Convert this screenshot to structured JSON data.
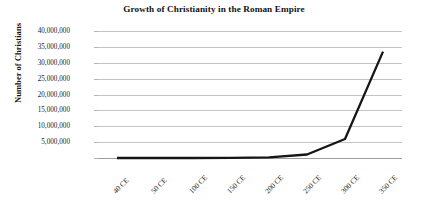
{
  "chart_data": {
    "type": "line",
    "title": "Growth of Christianity in the Roman Empire",
    "xlabel": "",
    "ylabel": "Number of Christians",
    "categories": [
      "40 CE",
      "50 CE",
      "100 CE",
      "150 CE",
      "200 CE",
      "250 CE",
      "300 CE",
      "350 CE"
    ],
    "values": [
      1000,
      1400,
      7500,
      40000,
      220000,
      1100000,
      6000000,
      33500000
    ],
    "series": [
      {
        "name": "Number of Christians",
        "values": [
          1000,
          1400,
          7500,
          40000,
          220000,
          1100000,
          6000000,
          33500000
        ]
      }
    ],
    "ylim": [
      0,
      40000000
    ],
    "ytick_values": [
      40000000,
      35000000,
      30000000,
      25000000,
      20000000,
      15000000,
      10000000,
      5000000,
      0
    ],
    "ytick_labels": [
      "40,000,000",
      "35,000,000",
      "30,000,000",
      "25,000,000",
      "20,000,000",
      "15,000,000",
      "10,000,000",
      "5,000,000",
      ""
    ],
    "grid": true,
    "legend": "none",
    "line_color": "#161616",
    "grid_color": "#c4c4c4",
    "axis_color": "#9d9d9d",
    "background_color": "#ffffff",
    "annotations": []
  }
}
